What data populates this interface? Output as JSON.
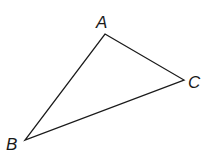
{
  "diagram": {
    "type": "triangle",
    "stroke_color": "#1a1a1a",
    "vertices": [
      {
        "name": "A",
        "x": 105,
        "y": 34,
        "label_x": 96,
        "label_y": 28
      },
      {
        "name": "C",
        "x": 184,
        "y": 80,
        "label_x": 188,
        "label_y": 88
      },
      {
        "name": "B",
        "x": 25,
        "y": 140,
        "label_x": 6,
        "label_y": 150
      }
    ],
    "labels": {
      "a": "A",
      "b": "B",
      "c": "C"
    }
  }
}
